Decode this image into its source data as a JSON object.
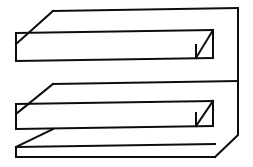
{
  "figure": {
    "kind": "line-drawing",
    "style": {
      "background_color": "#ffffff",
      "line_color": "#0d0d0d",
      "line_width": 2,
      "fill_color": "#ffffff"
    },
    "canvas": {
      "width": 253,
      "height": 167
    },
    "parts": [
      {
        "name": "top-slab",
        "label": "Top slab",
        "top_face": "53,11 238,8 213,30 28,33",
        "front_face": "16,33 213,30 213,58 16,61",
        "end_cap_diagonal": "196,58 213,30"
      },
      {
        "name": "middle-slab",
        "label": "Middle slab",
        "top_face": "53,84 238,81 213,101 28,104",
        "front_face": "16,104 213,101 213,126 16,129",
        "end_cap_diagonal": "196,126 213,101"
      },
      {
        "name": "bottom-slab",
        "label": "Bottom slab",
        "top_notch": "16,129 53,129 28,147 16,147",
        "front_face": "16,147 215,144 215,157 16,157"
      },
      {
        "name": "right-spine",
        "label": "Right vertical spine",
        "path": "238,8 238,135 215,157"
      }
    ],
    "strokes": [
      {
        "name": "top-edge",
        "d": "M 53 11 L 238 8"
      },
      {
        "name": "top-slab-left-bevel",
        "d": "M 53 11 L 16 44"
      },
      {
        "name": "top-slab-top-front-edge",
        "d": "M 28 33 L 213 30"
      },
      {
        "name": "top-slab-left-vertical",
        "d": "M 16 33 L 16 61"
      },
      {
        "name": "top-slab-front-top",
        "d": "M 16 33 L 213 30"
      },
      {
        "name": "top-slab-front-bottom",
        "d": "M 16 61 L 213 58"
      },
      {
        "name": "top-slab-cap-vertical",
        "d": "M 213 30 L 213 58"
      },
      {
        "name": "top-slab-cap-diagonal",
        "d": "M 196 58 L 213 30"
      },
      {
        "name": "top-slab-cap-inner-vertical",
        "d": "M 196 58 L 196 45"
      },
      {
        "name": "middle-slab-top-edge",
        "d": "M 53 84 L 238 81"
      },
      {
        "name": "middle-slab-left-bevel",
        "d": "M 53 84 L 16 114"
      },
      {
        "name": "middle-slab-left-vertical",
        "d": "M 16 104 L 16 129"
      },
      {
        "name": "middle-slab-front-top",
        "d": "M 16 104 L 213 101"
      },
      {
        "name": "middle-slab-front-bottom",
        "d": "M 16 129 L 213 126"
      },
      {
        "name": "middle-slab-cap-vertical",
        "d": "M 213 101 L 213 126"
      },
      {
        "name": "middle-slab-cap-diagonal",
        "d": "M 196 126 L 213 101"
      },
      {
        "name": "middle-slab-cap-inner-vertical",
        "d": "M 196 126 L 196 113"
      },
      {
        "name": "bottom-slab-notch",
        "d": "M 53 129 L 16 147"
      },
      {
        "name": "bottom-slab-front-top",
        "d": "M 16 147 L 215 144"
      },
      {
        "name": "bottom-slab-left-vertical",
        "d": "M 16 147 L 16 157"
      },
      {
        "name": "bottom-slab-front-bottom",
        "d": "M 16 157 L 215 157"
      },
      {
        "name": "right-spine-vertical",
        "d": "M 238 8 L 238 135"
      },
      {
        "name": "right-spine-bevel",
        "d": "M 238 135 L 215 157"
      }
    ]
  }
}
